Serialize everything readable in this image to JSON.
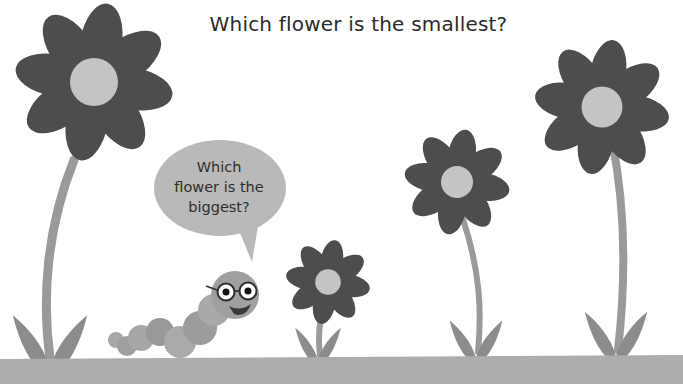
{
  "question": {
    "title": "Which flower is the smallest?"
  },
  "speech_bubble": {
    "line1": "Which",
    "line2": "flower is the",
    "line3": "biggest?"
  },
  "characters": {
    "caterpillar": "caterpillar-with-glasses"
  },
  "flowers": [
    {
      "id": "flower-1",
      "position": "far-left",
      "size": "large"
    },
    {
      "id": "flower-2",
      "position": "center-left",
      "size": "small"
    },
    {
      "id": "flower-3",
      "position": "center-right",
      "size": "medium"
    },
    {
      "id": "flower-4",
      "position": "far-right",
      "size": "large"
    }
  ],
  "colors": {
    "petal": "#4d4d4d",
    "center": "#c4c4c4",
    "stem": "#9a9a9a",
    "leaf": "#8c8c8c",
    "ground": "#adadad",
    "bubble": "#b9b9b9",
    "caterpillar": "#a3a3a3"
  }
}
